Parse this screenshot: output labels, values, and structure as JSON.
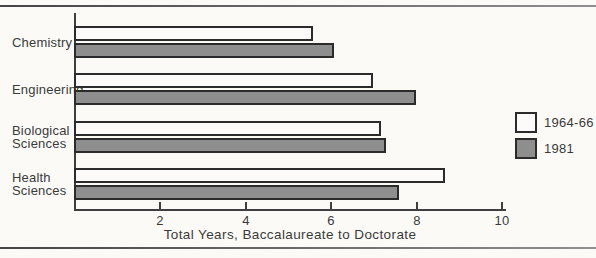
{
  "figure": {
    "background": "#fbfaf7",
    "rule_color": "#454545",
    "bar_border_color": "#2b2b2b",
    "text_color": "#3a3a3a"
  },
  "chart_data": {
    "type": "bar",
    "orientation": "horizontal",
    "xlabel": "Total Years, Baccalaureate to Doctorate",
    "xlim": [
      0,
      10
    ],
    "xticks": [
      2,
      4,
      6,
      8,
      10
    ],
    "grid": false,
    "legend_position": "right",
    "categories": [
      "Chemistry",
      "Engineering",
      "Biological Sciences",
      "Health Sciences"
    ],
    "series": [
      {
        "name": "1964-66",
        "fill": "#fcfbf9",
        "values": [
          5.6,
          7.0,
          7.2,
          8.7
        ]
      },
      {
        "name": "1981",
        "fill": "#8e8e8e",
        "values": [
          6.1,
          8.0,
          7.3,
          7.6
        ]
      }
    ]
  }
}
